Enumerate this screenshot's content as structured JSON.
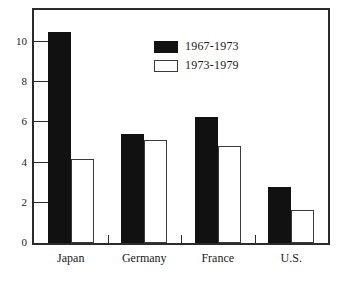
{
  "chart_data": {
    "type": "bar",
    "title": "",
    "subtitle": "",
    "xlabel": "",
    "ylabel": "",
    "categories": [
      "Japan",
      "Germany",
      "France",
      "U.S."
    ],
    "series": [
      {
        "name": "1967-1973",
        "style": "filled",
        "values": [
          10.5,
          5.45,
          6.25,
          2.8
        ]
      },
      {
        "name": "1973-1979",
        "style": "hollow",
        "values": [
          4.2,
          5.15,
          4.85,
          1.65
        ]
      }
    ],
    "ylim": [
      0,
      11.6
    ],
    "yticks": [
      0,
      2,
      4,
      6,
      8,
      10
    ],
    "ytick_labels": [
      "0",
      "2",
      "4",
      "6",
      "8",
      "10"
    ],
    "grid": false,
    "legend_position": "top-center",
    "frame": "box"
  },
  "legend": {
    "entries": [
      {
        "label": "1967-1973",
        "swatch": "filled-black-swatch"
      },
      {
        "label": "1973-1979",
        "swatch": "hollow-white-swatch"
      }
    ]
  }
}
